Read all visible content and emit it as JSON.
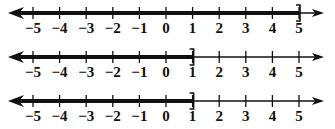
{
  "figure": {
    "tick_labels": [
      "−5",
      "−4",
      "−3",
      "−2",
      "−1",
      "0",
      "1",
      "2",
      "3",
      "4",
      "5"
    ],
    "tick_values": [
      -5,
      -4,
      -3,
      -2,
      -1,
      0,
      1,
      2,
      3,
      4,
      5
    ],
    "colors": {
      "ink": "#111111",
      "background": "#ffffff"
    },
    "number_lines": [
      {
        "id": "line-1",
        "shaded_from": "-infinity",
        "shaded_to": 5,
        "right_endpoint": "closed-bracket",
        "interval": "(-∞, 5]"
      },
      {
        "id": "line-2",
        "shaded_from": "-infinity",
        "shaded_to": 1,
        "right_endpoint": "closed-bracket",
        "interval": "(-∞, 1]"
      },
      {
        "id": "line-3",
        "shaded_from": "-infinity",
        "shaded_to": 1,
        "right_endpoint": "closed-bracket",
        "interval": "(-∞, 1]"
      }
    ]
  }
}
